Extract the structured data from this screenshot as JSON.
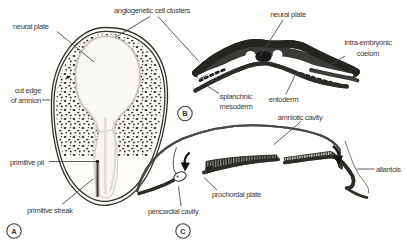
{
  "figure": {
    "kind": "embryology-textbook-illustration",
    "colors": {
      "background": "#fffffe",
      "ink": "#33312d",
      "label_text": "#3a3a3a",
      "mesoderm_gray": "#3d3b38",
      "bead_dark": "#2e2c29"
    }
  },
  "labels": {
    "angiogenetic": "angiogenetic cell clusters",
    "neural_plate_a": "neural plate",
    "cut_edge_1": "cut edge",
    "cut_edge_2": "of amnion",
    "primitive_pit": "primitive pit",
    "primitive_streak": "primitive streak",
    "neural_plate_b": "neural plate",
    "intra_embryonic_1": "intra-embryonic",
    "intra_embryonic_2": "coelom",
    "splanchnic_1": "splanchnic",
    "splanchnic_2": "mesoderm",
    "entoderm": "entoderm",
    "amniotic_cavity": "amniotic cavity",
    "prochordal_plate": "prochordal plate",
    "pericardial_cavity": "pericardial cavity",
    "allantois": "allantois"
  },
  "panels": {
    "a": "A",
    "b": "B",
    "c": "C"
  }
}
